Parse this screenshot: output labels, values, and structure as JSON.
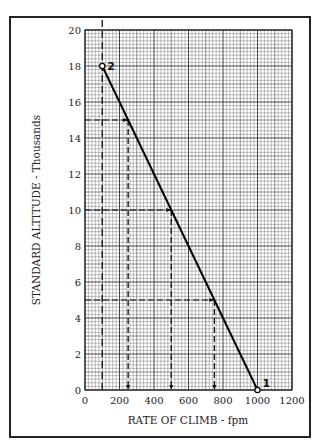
{
  "chart_data": {
    "type": "line",
    "title": "",
    "xlabel": "RATE OF CLIMB - fpm",
    "ylabel": "STANDARD ALTITUDE - Thousands",
    "xlim": [
      0,
      1200
    ],
    "ylim": [
      0,
      20
    ],
    "x_ticks": [
      "0",
      "200",
      "400",
      "600",
      "800",
      "1000",
      "1200"
    ],
    "y_ticks": [
      "0",
      "2",
      "4",
      "6",
      "8",
      "10",
      "12",
      "14",
      "16",
      "18",
      "20"
    ],
    "grid": true,
    "series": [
      {
        "name": "rate of climb line",
        "x": [
          1000,
          100
        ],
        "y": [
          0,
          18
        ]
      }
    ],
    "points": [
      {
        "label": "1",
        "x": 1000,
        "y": 0
      },
      {
        "label": "2",
        "x": 100,
        "y": 18
      }
    ],
    "reference_lines": [
      {
        "type": "vertical",
        "x": 100,
        "style": "dashed"
      },
      {
        "type": "readout",
        "y": 15,
        "x": 250
      },
      {
        "type": "readout",
        "y": 10,
        "x": 500
      },
      {
        "type": "readout",
        "y": 5,
        "x": 750
      }
    ]
  }
}
